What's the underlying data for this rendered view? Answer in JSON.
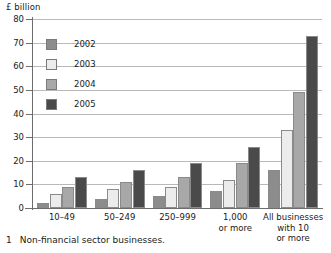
{
  "axis_unit_label": "£ billion",
  "footnote": {
    "marker": "1",
    "text": "Non-financial sector businesses."
  },
  "colors": {
    "2002": "#8c8c8c",
    "2003": "#ececec",
    "2004": "#a8a8a8",
    "2005": "#4a4a4a",
    "gridline": "#b9b9b9",
    "axis": "#6d6d6d",
    "text": "#1a1a1a",
    "background": "#ffffff"
  },
  "legend": {
    "items": [
      {
        "label": "2002",
        "color_key": "2002"
      },
      {
        "label": "2003",
        "color_key": "2003"
      },
      {
        "label": "2004",
        "color_key": "2004"
      },
      {
        "label": "2005",
        "color_key": "2005"
      }
    ]
  },
  "chart_data": {
    "type": "bar",
    "title": "",
    "subtitle": "",
    "xlabel": "",
    "ylabel": "£ billion",
    "ylim": [
      0,
      80
    ],
    "yticks": [
      0,
      10,
      20,
      30,
      40,
      50,
      60,
      70,
      80
    ],
    "ytick_labels": [
      "0",
      "10",
      "20",
      "30",
      "40",
      "50",
      "60",
      "70",
      "80"
    ],
    "grid": true,
    "grid_axis": "y",
    "legend_position": "inside-top-left",
    "categories": [
      "10–49",
      "50–249",
      "250–999",
      "1,000\nor more",
      "All businesses\nwith 10\nor more"
    ],
    "series": [
      {
        "name": "2002",
        "color": "#8c8c8c",
        "values": [
          2,
          4,
          5,
          7,
          16
        ]
      },
      {
        "name": "2003",
        "color": "#ececec",
        "values": [
          6,
          8,
          9,
          12,
          33
        ]
      },
      {
        "name": "2004",
        "color": "#a8a8a8",
        "values": [
          9,
          11,
          13,
          19,
          49
        ]
      },
      {
        "name": "2005",
        "color": "#4a4a4a",
        "values": [
          13,
          16,
          19,
          26,
          73
        ]
      }
    ],
    "annotations": []
  }
}
